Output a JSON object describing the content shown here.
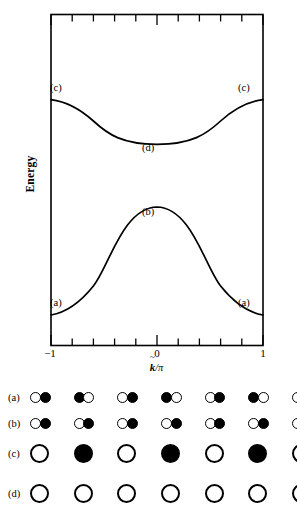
{
  "figure": {
    "axes": {
      "ylabel": "Energy",
      "xlabel_k": "k",
      "xlabel_slash": "/",
      "xlabel_pi": "π",
      "xticks": [
        "−1",
        "0",
        "1"
      ]
    },
    "annotations": {
      "c_left": "(c)",
      "c_right": "(c)",
      "d": "(d)",
      "b": "(b)",
      "a_left": "(a)",
      "a_right": "(a)"
    }
  },
  "chart_data": {
    "type": "line",
    "title": "",
    "xlabel": "k̃/π",
    "ylabel": "Energy",
    "xlim": [
      -1,
      1
    ],
    "ylim": [
      0,
      1
    ],
    "grid": false,
    "legend": false,
    "xticks": [
      -1,
      -0.8,
      -0.6,
      -0.4,
      -0.2,
      0,
      0.2,
      0.4,
      0.6,
      0.8,
      1
    ],
    "xtick_labels": [
      "−1",
      "",
      "",
      "",
      "",
      "0",
      "",
      "",
      "",
      "",
      "1"
    ],
    "ytick_labels": [],
    "series": [
      {
        "name": "upper band (conduction)",
        "endpoint_label": "(c)",
        "center_label": "(d)",
        "x": [
          -1,
          -0.9,
          -0.8,
          -0.7,
          -0.6,
          -0.5,
          -0.4,
          -0.3,
          -0.2,
          -0.1,
          0,
          0.1,
          0.2,
          0.3,
          0.4,
          0.5,
          0.6,
          0.7,
          0.8,
          0.9,
          1
        ],
        "y": [
          0.742,
          0.737,
          0.722,
          0.699,
          0.67,
          0.637,
          0.604,
          0.574,
          0.551,
          0.537,
          0.532,
          0.537,
          0.551,
          0.574,
          0.604,
          0.637,
          0.67,
          0.699,
          0.722,
          0.737,
          0.742
        ]
      },
      {
        "name": "lower band (valence)",
        "endpoint_label": "(a)",
        "center_label": "(b)",
        "x": [
          -1,
          -0.9,
          -0.8,
          -0.7,
          -0.6,
          -0.5,
          -0.4,
          -0.3,
          -0.2,
          -0.1,
          0,
          0.1,
          0.2,
          0.3,
          0.4,
          0.5,
          0.6,
          0.7,
          0.8,
          0.9,
          1
        ],
        "y": [
          0.092,
          0.099,
          0.119,
          0.153,
          0.199,
          0.253,
          0.311,
          0.366,
          0.41,
          0.437,
          0.446,
          0.437,
          0.41,
          0.366,
          0.311,
          0.253,
          0.199,
          0.153,
          0.119,
          0.099,
          0.092
        ]
      }
    ]
  },
  "orbital_panel": {
    "cell_count": 7,
    "rows": [
      {
        "label": "(a)",
        "style": "small-pair",
        "cells": [
          [
            "open",
            "filled"
          ],
          [
            "filled",
            "open"
          ],
          [
            "open",
            "filled"
          ],
          [
            "filled",
            "open"
          ],
          [
            "open",
            "filled"
          ],
          [
            "filled",
            "open"
          ],
          [
            "open",
            "filled"
          ]
        ]
      },
      {
        "label": "(b)",
        "style": "small-pair",
        "cells": [
          [
            "open",
            "filled"
          ],
          [
            "open",
            "filled"
          ],
          [
            "open",
            "filled"
          ],
          [
            "open",
            "filled"
          ],
          [
            "open",
            "filled"
          ],
          [
            "open",
            "filled"
          ],
          [
            "open",
            "filled"
          ]
        ]
      },
      {
        "label": "(c)",
        "style": "large-single",
        "cells": [
          [
            "open"
          ],
          [
            "filled"
          ],
          [
            "open"
          ],
          [
            "filled"
          ],
          [
            "open"
          ],
          [
            "filled"
          ],
          [
            "open"
          ]
        ]
      },
      {
        "label": "(d)",
        "style": "large-single",
        "cells": [
          [
            "open"
          ],
          [
            "open"
          ],
          [
            "open"
          ],
          [
            "open"
          ],
          [
            "open"
          ],
          [
            "open"
          ],
          [
            "open"
          ]
        ]
      }
    ]
  }
}
